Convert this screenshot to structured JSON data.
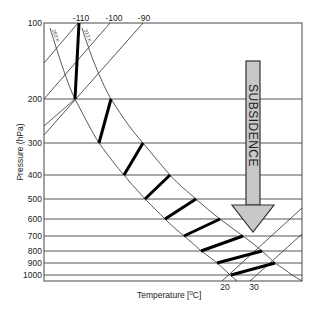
{
  "diagram": {
    "type": "skew-T thermodynamic diagram (schematic)",
    "y_axis": {
      "title": "Pressure (hPa)",
      "ticks": [
        "100",
        "200",
        "300",
        "400",
        "500",
        "600",
        "700",
        "800",
        "900",
        "1000"
      ]
    },
    "x_axis": {
      "title": "Temperature [",
      "title_unit_sup": "0",
      "title_unit_rest": "C]",
      "bottom_ticks": [
        "20",
        "30"
      ],
      "top_ticks": [
        "-110",
        "-100",
        "-90"
      ]
    },
    "curve_labels": {
      "left": "263 K",
      "right": "313 K"
    },
    "arrow": {
      "label": "SUBSIDENCE",
      "fill": "#c8c8c8",
      "stroke": "#333333"
    },
    "colors": {
      "grid": "#555555",
      "thick_segment": "#000000",
      "background": "#ffffff"
    }
  }
}
